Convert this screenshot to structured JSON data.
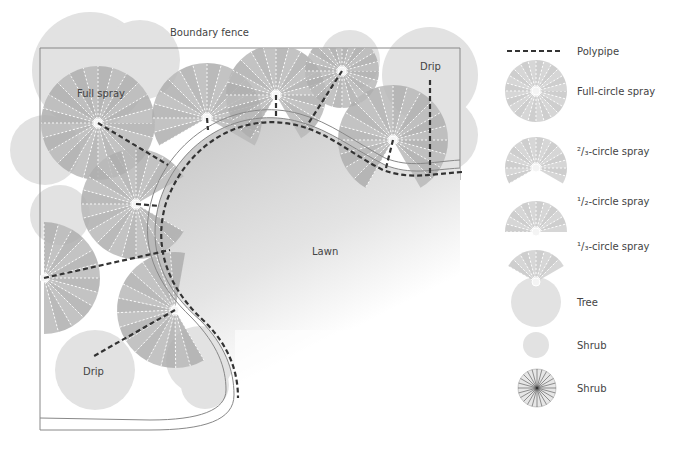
{
  "labels": {
    "fence": "Boundary fence",
    "full_spray": "Full spray",
    "drip_top": "Drip",
    "drip_bottom": "Drip",
    "lawn": "Lawn"
  },
  "legend": [
    {
      "key": "polypipe",
      "label": "Polypipe",
      "symbol": "dashed-line"
    },
    {
      "key": "full",
      "label": "Full-circle spray",
      "symbol": "spray-360"
    },
    {
      "key": "two_thirds",
      "label": "²/₃-circle spray",
      "symbol": "spray-240"
    },
    {
      "key": "half",
      "label": "¹/₂-circle spray",
      "symbol": "spray-180"
    },
    {
      "key": "third",
      "label": "¹/₃-circle spray",
      "symbol": "spray-120"
    },
    {
      "key": "tree",
      "label": "Tree",
      "symbol": "tree-blob"
    },
    {
      "key": "shrub",
      "label": "Shrub",
      "symbol": "shrub-blob"
    },
    {
      "key": "shrub2",
      "label": "Shrub",
      "symbol": "shrub-fine"
    }
  ],
  "colors": {
    "spray": "#b8b8b8",
    "spray_dark": "#a4a4a4",
    "tree": "#dedede",
    "lawn_top": "#c9c9c9",
    "lawn_bottom": "#ffffff",
    "pipe": "#333333",
    "fence": "#888888"
  }
}
